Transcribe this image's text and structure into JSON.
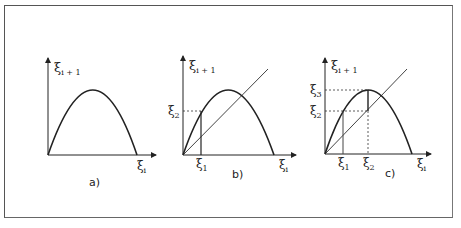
{
  "figure": {
    "panels": [
      {
        "id": "a",
        "caption": "a)",
        "y_axis_label": "ξ",
        "y_axis_sub": "i + 1",
        "x_axis_label": "ξ",
        "x_axis_sub": "i"
      },
      {
        "id": "b",
        "caption": "b)",
        "y_axis_label": "ξ",
        "y_axis_sub": "i + 1",
        "x_axis_label": "ξ",
        "x_axis_sub": "i",
        "marks": [
          {
            "label": "ξ",
            "sub": "1",
            "axis": "x"
          },
          {
            "label": "ξ",
            "sub": "2",
            "axis": "y"
          }
        ]
      },
      {
        "id": "c",
        "caption": "c)",
        "y_axis_label": "ξ",
        "y_axis_sub": "i + 1",
        "x_axis_label": "ξ",
        "x_axis_sub": "i",
        "marks": [
          {
            "label": "ξ",
            "sub": "1",
            "axis": "x"
          },
          {
            "label": "ξ",
            "sub": "2",
            "axis": "x"
          },
          {
            "label": "ξ",
            "sub": "3",
            "axis": "y"
          },
          {
            "label": "ξ",
            "sub": "2",
            "axis": "y"
          }
        ]
      }
    ]
  }
}
